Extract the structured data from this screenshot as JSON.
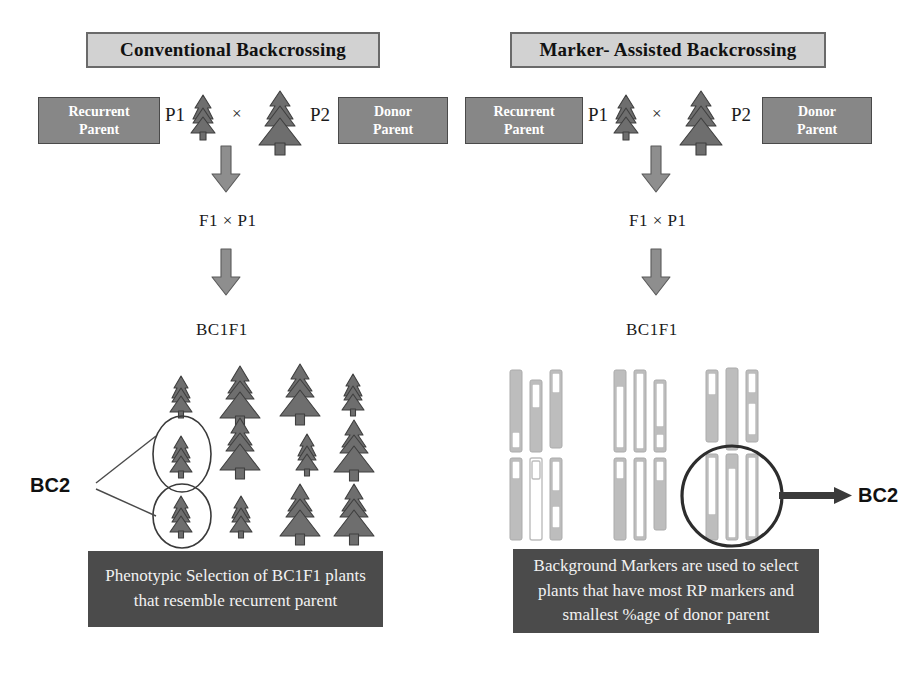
{
  "diagram": {
    "panels": [
      {
        "id": "conventional",
        "heading": "Conventional Backcrossing",
        "recurrent_parent_label": {
          "line1": "Recurrent",
          "line2": "Parent"
        },
        "donor_parent_label": {
          "line1": "Donor",
          "line2": "Parent"
        },
        "p1_label": "P1",
        "p2_label": "P2",
        "cross_symbol": "×",
        "generation_1": "F1 × P1",
        "generation_2": "BC1F1",
        "selection_label": "BC2",
        "note": {
          "line1": "Phenotypic Selection of BC1F1 plants",
          "line2": "that resemble recurrent parent"
        },
        "progeny": {
          "type": "trees",
          "rows": 3,
          "columns": 4,
          "circled_count": 2,
          "tree_sizes": [
            [
              "small",
              "large",
              "large",
              "small"
            ],
            [
              "small",
              "large",
              "small",
              "large"
            ],
            [
              "small",
              "small",
              "large",
              "large"
            ]
          ]
        }
      },
      {
        "id": "marker-assisted",
        "heading": "Marker- Assisted Backcrossing",
        "recurrent_parent_label": {
          "line1": "Recurrent",
          "line2": "Parent"
        },
        "donor_parent_label": {
          "line1": "Donor",
          "line2": "Parent"
        },
        "p1_label": "P1",
        "p2_label": "P2",
        "cross_symbol": "×",
        "generation_1": "F1 × P1",
        "generation_2": "BC1F1",
        "selection_label": "BC2",
        "note": {
          "line1": "Background Markers are used to select",
          "line2": "plants that have most RP markers and",
          "line3": "smallest %age of donor parent"
        },
        "progeny": {
          "type": "chromosome-bars",
          "groups": 3,
          "bars_per_group": 3,
          "rows": 2,
          "selected_group_index": 3,
          "legend": {
            "grey": "donor parent segment",
            "white": "recurrent parent segment"
          }
        }
      }
    ],
    "colors": {
      "title_box_fill": "#d2d2d2",
      "title_box_border": "#6a6a6a",
      "parent_box_fill": "#878787",
      "parent_box_text": "#ffffff",
      "tree_fill": "#6e6e6e",
      "tree_outline": "#3f3f3f",
      "arrow_fill": "#8e8e8e",
      "note_box_fill": "#4b4b4b",
      "note_box_text": "#f2f2f2",
      "chromosome_grey": "#bdbdbd",
      "chromosome_white": "#ffffff",
      "background": "#ffffff"
    }
  }
}
